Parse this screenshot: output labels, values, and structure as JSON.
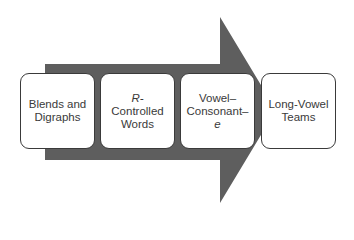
{
  "arrow": {
    "color": "#5e5e5e"
  },
  "steps": [
    {
      "lines": [
        "Blends and",
        "Digraphs"
      ]
    },
    {
      "lines": [
        "R-",
        "Controlled",
        "Words"
      ],
      "italic_line": 0
    },
    {
      "lines": [
        "Vowel–",
        "Consonant–",
        "e"
      ],
      "italic_line": 2
    },
    {
      "lines": [
        "Long-Vowel",
        "Teams"
      ]
    }
  ]
}
